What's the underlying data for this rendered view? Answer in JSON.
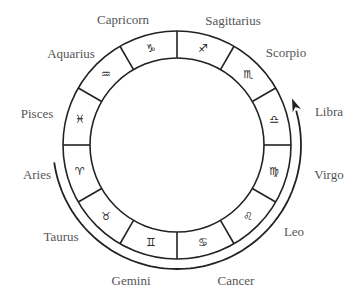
{
  "diagram": {
    "signs": [
      {
        "name": "Capricorn",
        "symbol": "♑"
      },
      {
        "name": "Sagittarius",
        "symbol": "♐"
      },
      {
        "name": "Scorpio",
        "symbol": "♏"
      },
      {
        "name": "Libra",
        "symbol": "♎"
      },
      {
        "name": "Virgo",
        "symbol": "♍"
      },
      {
        "name": "Leo",
        "symbol": "♌"
      },
      {
        "name": "Cancer",
        "symbol": "♋"
      },
      {
        "name": "Gemini",
        "symbol": "♊"
      },
      {
        "name": "Taurus",
        "symbol": "♉"
      },
      {
        "name": "Aries",
        "symbol": "♈"
      },
      {
        "name": "Pisces",
        "symbol": "♓"
      },
      {
        "name": "Aquarius",
        "symbol": "♒"
      }
    ],
    "arrow": {
      "direction": "counterclockwise",
      "from": "Aries",
      "to": "Libra",
      "path": "through Taurus, Gemini, Cancer, Leo, Virgo"
    },
    "colors": {
      "line": "#222222",
      "label": "#555555",
      "background": "#ffffff"
    }
  }
}
